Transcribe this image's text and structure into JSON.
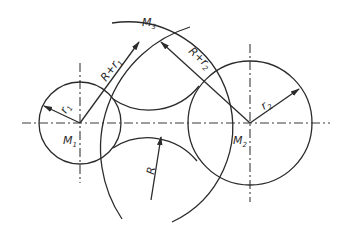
{
  "diagram": {
    "type": "geometric construction: concave arc tangent to two circles",
    "labels": {
      "m1": "M",
      "m1_sub": "1",
      "m2": "M",
      "m2_sub": "2",
      "m3": "M",
      "m3_sub": "3",
      "r1": "r",
      "r1_sub": "1",
      "r2": "r",
      "r2_sub": "2",
      "R": "R",
      "R_plus_r1": "R+r",
      "R_plus_r1_sub": "1",
      "R_plus_r2": "R+r",
      "R_plus_r2_sub": "2"
    },
    "colors": {
      "line": "#2b2b2b",
      "background": "#ffffff"
    },
    "geometry": {
      "circle1": {
        "cx": 80,
        "cy": 123,
        "r": 41
      },
      "circle2": {
        "cx": 250,
        "cy": 123,
        "r": 62
      },
      "R": 64,
      "M3": {
        "x": 150,
        "y": 45
      },
      "M4": {
        "x": 151,
        "y": 200
      }
    }
  }
}
